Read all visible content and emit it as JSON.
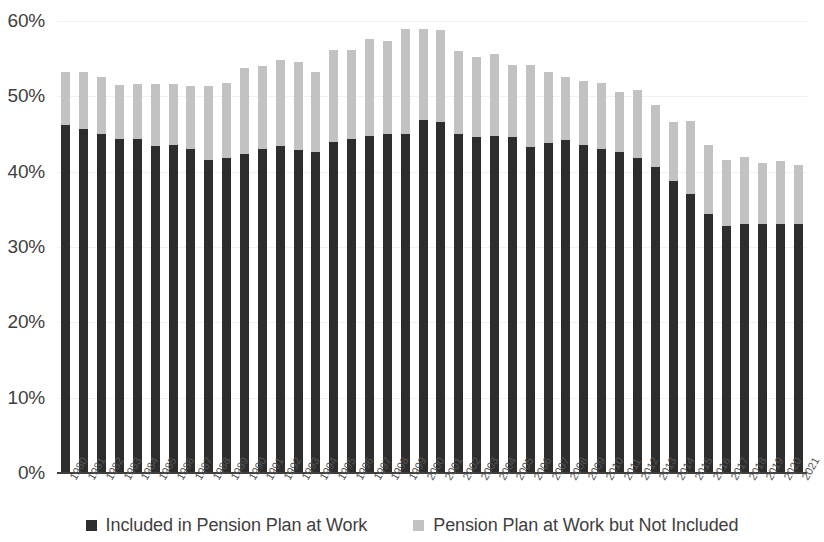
{
  "chart_data": {
    "type": "bar",
    "subtype": "stacked-column",
    "title": "",
    "xlabel": "",
    "ylabel": "",
    "ylim": [
      0,
      60
    ],
    "yticks": [
      0,
      10,
      20,
      30,
      40,
      50,
      60
    ],
    "ytick_labels": [
      "0%",
      "10%",
      "20%",
      "30%",
      "40%",
      "50%",
      "60%"
    ],
    "grid": true,
    "legend_position": "bottom",
    "categories": [
      "1980",
      "1981",
      "1982",
      "1983",
      "1984",
      "1985",
      "1986",
      "1987",
      "1988",
      "1989",
      "1990",
      "1991",
      "1992",
      "1993",
      "1994",
      "1995",
      "1996",
      "1997",
      "1998",
      "1999",
      "2000",
      "2001",
      "2002",
      "2003",
      "2004",
      "2005",
      "2006",
      "2007",
      "2008",
      "2009",
      "2010",
      "2011",
      "2012",
      "2013",
      "2014",
      "2015",
      "2016",
      "2017",
      "2018",
      "2019",
      "2020",
      "2021"
    ],
    "series": [
      {
        "name": "Included in Pension Plan at Work",
        "color": "#2d2d2d",
        "values": [
          46.2,
          45.6,
          45.0,
          44.3,
          44.4,
          43.4,
          43.5,
          43.0,
          41.6,
          41.8,
          42.4,
          43.0,
          43.4,
          42.9,
          42.6,
          44.0,
          44.4,
          44.8,
          45.0,
          45.0,
          46.8,
          46.6,
          45.0,
          44.6,
          44.8,
          44.6,
          43.3,
          43.8,
          44.2,
          43.6,
          43.0,
          42.6,
          41.8,
          40.6,
          38.8,
          37.0,
          34.4,
          32.8,
          33.0,
          33.0,
          33.0,
          33.0
        ]
      },
      {
        "name": "Pension Plan at Work but Not Included",
        "color": "#c2c2c2",
        "values": [
          7.0,
          7.6,
          7.6,
          7.2,
          7.2,
          8.2,
          8.2,
          8.4,
          9.8,
          10.0,
          11.4,
          11.0,
          11.4,
          11.6,
          10.6,
          12.2,
          11.8,
          12.8,
          12.4,
          14.0,
          12.2,
          12.2,
          11.0,
          10.6,
          10.8,
          9.6,
          10.8,
          9.4,
          8.4,
          8.4,
          8.8,
          8.0,
          9.0,
          8.2,
          7.8,
          9.7,
          9.2,
          8.8,
          9.0,
          8.2,
          8.4,
          7.9
        ]
      }
    ],
    "totals": [
      53.2,
      53.2,
      52.6,
      51.5,
      51.6,
      51.6,
      51.7,
      51.4,
      51.4,
      51.8,
      53.8,
      54.0,
      54.8,
      54.5,
      53.2,
      56.2,
      56.2,
      57.6,
      57.4,
      59.0,
      59.0,
      58.8,
      56.0,
      55.2,
      55.6,
      54.2,
      54.1,
      53.2,
      52.6,
      52.0,
      51.8,
      50.6,
      50.8,
      48.8,
      46.6,
      46.7,
      43.6,
      41.6,
      42.0,
      41.2,
      41.4,
      40.9
    ]
  },
  "legend": {
    "items": [
      {
        "label": "Included in Pension Plan at Work",
        "color": "#2d2d2d"
      },
      {
        "label": "Pension Plan at Work but Not Included",
        "color": "#c2c2c2"
      }
    ]
  }
}
